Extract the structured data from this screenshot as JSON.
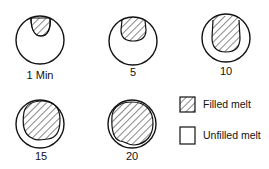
{
  "figure": {
    "stages": [
      {
        "label": "1 Min",
        "fill_fraction": 0.2
      },
      {
        "label": "5",
        "fill_fraction": 0.35
      },
      {
        "label": "10",
        "fill_fraction": 0.55
      },
      {
        "label": "15",
        "fill_fraction": 0.8
      },
      {
        "label": "20",
        "fill_fraction": 0.9
      }
    ],
    "legend": {
      "filled": "Filled melt",
      "unfilled": "Unfilled melt"
    },
    "colors": {
      "stroke": "#111111",
      "background": "#ffffff"
    }
  }
}
